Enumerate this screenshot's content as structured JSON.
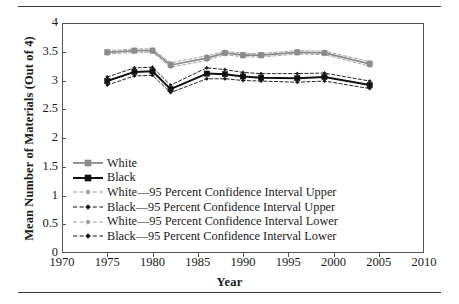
{
  "figure": {
    "rules": [
      "top-rule",
      "bottom-rule"
    ]
  },
  "chart_data": {
    "type": "line",
    "title": "",
    "xlabel": "Year",
    "ylabel": "Mean Number of Materials (Out of 4)",
    "xlim": [
      1970,
      2010
    ],
    "ylim": [
      0,
      4
    ],
    "xticks": [
      1970,
      1975,
      1980,
      1985,
      1990,
      1995,
      2000,
      2005,
      2010
    ],
    "xtick_labels": [
      "1970",
      "1975",
      "1980",
      "1985",
      "1990",
      "1995",
      "2000",
      "2005",
      "2010"
    ],
    "yticks": [
      0,
      0.5,
      1,
      1.5,
      2,
      2.5,
      3,
      3.5,
      4
    ],
    "ytick_labels": [
      "0",
      "0.5",
      "1",
      "1.5",
      "2",
      "2.5",
      "3",
      "3.5",
      "4"
    ],
    "grid": false,
    "legend_position": "center-left-inside",
    "x": [
      1975,
      1978,
      1980,
      1982,
      1986,
      1988,
      1990,
      1992,
      1996,
      1999,
      2004
    ],
    "series": [
      {
        "name": "White",
        "key": "white",
        "color": "#8a8a8a",
        "marker": "square",
        "linestyle": "solid",
        "values": [
          3.49,
          3.52,
          3.52,
          3.27,
          3.39,
          3.48,
          3.44,
          3.44,
          3.49,
          3.48,
          3.29
        ]
      },
      {
        "name": "Black",
        "key": "black",
        "color": "#111111",
        "marker": "square",
        "linestyle": "solid",
        "values": [
          2.99,
          3.15,
          3.16,
          2.85,
          3.12,
          3.11,
          3.07,
          3.05,
          3.04,
          3.06,
          2.92
        ]
      },
      {
        "name": "White—95 Percent Confidence Interval Upper",
        "key": "white_ci_upper",
        "color": "#9a9a9a",
        "marker": "diamond",
        "linestyle": "dashed",
        "values": [
          3.52,
          3.55,
          3.55,
          3.31,
          3.43,
          3.51,
          3.47,
          3.47,
          3.52,
          3.51,
          3.33
        ]
      },
      {
        "name": "Black—95 Percent Confidence Interval Upper",
        "key": "black_ci_upper",
        "color": "#111111",
        "marker": "diamond",
        "linestyle": "dashed",
        "values": [
          3.06,
          3.22,
          3.23,
          2.92,
          3.22,
          3.19,
          3.14,
          3.12,
          3.12,
          3.13,
          2.99
        ]
      },
      {
        "name": "White—95 Percent Confidence Interval Lower",
        "key": "white_ci_lower",
        "color": "#9a9a9a",
        "marker": "diamond",
        "linestyle": "dashed",
        "values": [
          3.46,
          3.49,
          3.49,
          3.23,
          3.35,
          3.45,
          3.41,
          3.41,
          3.46,
          3.45,
          3.25
        ]
      },
      {
        "name": "Black—95 Percent Confidence Interval Lower",
        "key": "black_ci_lower",
        "color": "#111111",
        "marker": "diamond",
        "linestyle": "dashed",
        "values": [
          2.92,
          3.08,
          3.09,
          2.79,
          3.03,
          3.03,
          3.0,
          2.99,
          2.97,
          2.99,
          2.86
        ]
      }
    ],
    "legend": [
      {
        "label": "White",
        "color": "#8a8a8a",
        "marker": "square",
        "linestyle": "solid"
      },
      {
        "label": "Black",
        "color": "#111111",
        "marker": "square",
        "linestyle": "solid"
      },
      {
        "label": "White—95 Percent Confidence Interval Upper",
        "color": "#9a9a9a",
        "marker": "diamond",
        "linestyle": "dashed"
      },
      {
        "label": "Black—95 Percent Confidence Interval Upper",
        "color": "#111111",
        "marker": "diamond",
        "linestyle": "dashed"
      },
      {
        "label": "White—95 Percent Confidence Interval Lower",
        "color": "#9a9a9a",
        "marker": "diamond",
        "linestyle": "dashed"
      },
      {
        "label": "Black—95 Percent Confidence Interval Lower",
        "color": "#111111",
        "marker": "diamond",
        "linestyle": "dashed"
      }
    ]
  },
  "colors": {
    "white_series": "#8a8a8a",
    "black_series": "#111111",
    "axis": "#555555",
    "rule": "#3a3a3a",
    "text": "#1a1a1a"
  }
}
